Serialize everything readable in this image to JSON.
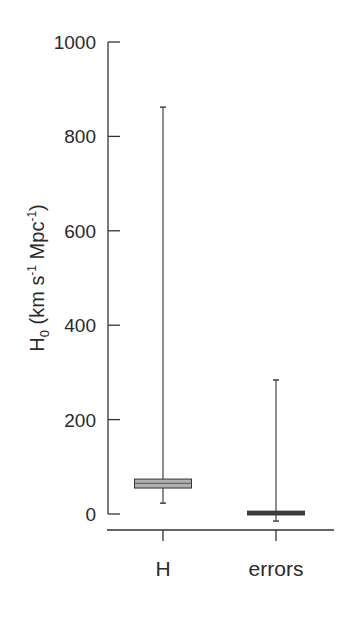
{
  "chart_data": {
    "type": "boxplot",
    "title": "",
    "xlabel": "",
    "ylabel": "H0 (km s-1 Mpc-1)",
    "ylabel_parts": {
      "main": "H",
      "sub": "0",
      "rest1": " (km s",
      "sup1": "-1",
      "rest2": " Mpc",
      "sup2": "-1",
      "end": ")"
    },
    "ylim": [
      0,
      1000
    ],
    "yticks": [
      0,
      200,
      400,
      600,
      800,
      1000
    ],
    "categories": [
      "H",
      "errors"
    ],
    "grid": false,
    "legend": null,
    "series": [
      {
        "name": "H",
        "whisker_low": 23,
        "q1": 55,
        "median": 65,
        "q3": 74,
        "whisker_high": 862,
        "fill": "#b0b0b0"
      },
      {
        "name": "errors",
        "whisker_low": -15,
        "q1": -2,
        "median": 2,
        "q3": 6,
        "whisker_high": 284,
        "fill": "#2a2a2a"
      }
    ]
  },
  "colors": {
    "axis": "#333333",
    "text": "#2a2a2a",
    "h_box": "#b0b0b0",
    "errors_box": "#2a2a2a"
  }
}
